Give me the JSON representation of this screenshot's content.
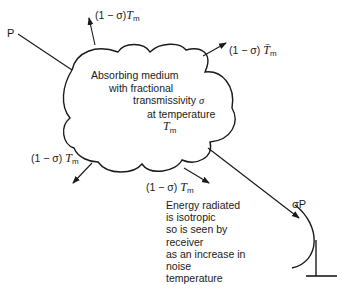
{
  "diagram": {
    "type": "radiation-through-absorbing-medium",
    "source_label": "P",
    "received_label": "σP",
    "medium": {
      "lines": [
        "Absorbing medium",
        "with fractional",
        "transmissivity σ",
        "at temperature",
        "T_m"
      ]
    },
    "emission_labels": [
      {
        "id": "top",
        "prefix": "(1 − σ)",
        "var": "T",
        "sub": "m"
      },
      {
        "id": "right",
        "prefix": "(1 − σ)",
        "var": "T̄",
        "sub": "m"
      },
      {
        "id": "left",
        "prefix": "(1 − σ)",
        "var": "T",
        "sub": "m"
      },
      {
        "id": "bottom",
        "prefix": "(1 − σ)",
        "var": "T",
        "sub": "m"
      }
    ],
    "note": {
      "lines": [
        "Energy radiated",
        "is isotropic",
        "so is seen by",
        "receiver",
        "as an increase in",
        "noise",
        "temperature"
      ]
    },
    "receiver": "dish-antenna",
    "colors": {
      "line": "#1a1a1a",
      "background": "#ffffff"
    }
  }
}
